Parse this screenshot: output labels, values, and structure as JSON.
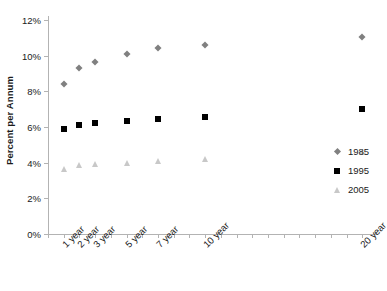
{
  "chart_data": {
    "type": "scatter",
    "title": "",
    "xlabel": "",
    "ylabel": "Percent per Annum",
    "categories": [
      "1 year",
      "2 year",
      "3 year",
      "5 year",
      "7 year",
      "10 year",
      "20 year"
    ],
    "x": [
      1,
      2,
      3,
      5,
      7,
      10,
      20
    ],
    "series": [
      {
        "name": "1985",
        "marker": "diamond",
        "color": "#808080",
        "values": [
          8.4,
          9.3,
          9.65,
          10.1,
          10.45,
          10.6,
          11.05
        ]
      },
      {
        "name": "1995",
        "marker": "square",
        "color": "#000000",
        "values": [
          5.9,
          6.1,
          6.25,
          6.35,
          6.45,
          6.55,
          7.0
        ]
      },
      {
        "name": "2005",
        "marker": "triangle",
        "color": "#c8c8c8",
        "values": [
          3.65,
          3.85,
          3.9,
          4.0,
          4.1,
          4.2,
          4.6
        ]
      }
    ],
    "ylim": [
      0,
      12
    ],
    "ytick_step": 2,
    "ytick_labels": [
      "0%",
      "2%",
      "4%",
      "6%",
      "8%",
      "10%",
      "12%"
    ],
    "ytick_values": [
      0,
      2,
      4,
      6,
      8,
      10,
      12
    ],
    "xlim": [
      0,
      21
    ],
    "xtick_values": [
      1,
      2,
      3,
      4,
      5,
      6,
      7,
      8,
      9,
      10,
      11,
      12,
      13,
      14,
      15,
      16,
      17,
      18,
      19,
      20
    ],
    "grid": false,
    "legend_position": "right",
    "legend_entries": [
      "1985",
      "1995",
      "2005"
    ],
    "axis_color": "#b3b3b3",
    "text_color": "#1a1a1a",
    "background": "#ffffff"
  }
}
